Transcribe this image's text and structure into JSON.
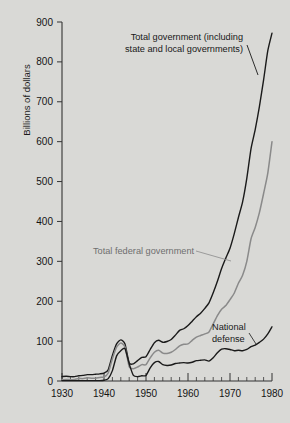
{
  "chart_data": {
    "type": "line",
    "title": "",
    "xlabel": "",
    "ylabel": "Billions of dollars",
    "xlim": [
      1930,
      1980
    ],
    "ylim": [
      0,
      900
    ],
    "grid": false,
    "legend_position": "inline-annotations",
    "xticks": [
      "1930",
      "1940",
      "1950",
      "1960",
      "1970",
      "1980"
    ],
    "xtick_values": [
      1930,
      1940,
      1950,
      1960,
      1970,
      1980
    ],
    "ytick_values": [
      0,
      100,
      200,
      300,
      400,
      500,
      600,
      700,
      800,
      900
    ],
    "yticks": [
      "0",
      "100",
      "200",
      "300",
      "400",
      "500",
      "600",
      "700",
      "800",
      "900"
    ],
    "minor_xtick_interval": 2,
    "x": [
      1930,
      1931,
      1932,
      1933,
      1934,
      1935,
      1936,
      1937,
      1938,
      1939,
      1940,
      1941,
      1942,
      1943,
      1944,
      1945,
      1946,
      1947,
      1948,
      1949,
      1950,
      1951,
      1952,
      1953,
      1954,
      1955,
      1956,
      1957,
      1958,
      1959,
      1960,
      1961,
      1962,
      1963,
      1964,
      1965,
      1966,
      1967,
      1968,
      1969,
      1970,
      1971,
      1972,
      1973,
      1974,
      1975,
      1976,
      1977,
      1978,
      1979,
      1980
    ],
    "series": [
      {
        "name": "Total government (including state and local governments)",
        "color": "#1a1a1a",
        "values": [
          11,
          12,
          11,
          11,
          13,
          14,
          16,
          16,
          17,
          18,
          20,
          28,
          64,
          93,
          103,
          93,
          45,
          43,
          51,
          59,
          61,
          79,
          96,
          102,
          97,
          99,
          104,
          115,
          127,
          131,
          139,
          150,
          161,
          170,
          182,
          196,
          221,
          250,
          282,
          308,
          333,
          369,
          410,
          449,
          508,
          582,
          630,
          688,
          755,
          828,
          872
        ]
      },
      {
        "name": "Total federal government",
        "color": "#8a8a8a",
        "values": [
          3,
          4,
          3,
          4,
          6,
          6,
          8,
          7,
          7,
          9,
          10,
          20,
          56,
          85,
          95,
          85,
          36,
          31,
          35,
          41,
          41,
          58,
          72,
          77,
          70,
          69,
          72,
          79,
          88,
          92,
          93,
          102,
          110,
          114,
          118,
          123,
          143,
          164,
          180,
          189,
          204,
          220,
          245,
          265,
          300,
          356,
          385,
          422,
          470,
          521,
          600
        ]
      },
      {
        "name": "National defense",
        "color": "#1a1a1a",
        "values": [
          1,
          1,
          1,
          1,
          1,
          1,
          1,
          1,
          1,
          1,
          2,
          6,
          26,
          63,
          76,
          81,
          43,
          14,
          11,
          13,
          14,
          33,
          46,
          49,
          41,
          39,
          40,
          44,
          45,
          46,
          45,
          47,
          51,
          52,
          53,
          50,
          58,
          71,
          80,
          81,
          79,
          76,
          77,
          76,
          79,
          86,
          90,
          97,
          105,
          118,
          136
        ]
      }
    ],
    "annotations": [
      {
        "name": "total-government-label",
        "lines": [
          "Total government (including",
          "state and local governments)"
        ],
        "color": "#181818"
      },
      {
        "name": "total-federal-government-label",
        "lines": [
          "Total federal government"
        ],
        "color": "#6f6f6f"
      },
      {
        "name": "national-defense-label",
        "lines": [
          "National",
          "defense"
        ],
        "color": "#181818"
      }
    ]
  },
  "figure": {
    "background_color": "#d9d9d6",
    "axis_color": "#333333"
  }
}
